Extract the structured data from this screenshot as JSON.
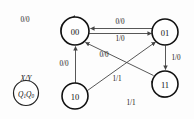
{
  "diagram": {
    "kind": "mealy-state-transition-diagram",
    "width": 194,
    "height": 119,
    "background_color": "#fdfdfd",
    "node_stroke_color": "#111111",
    "edge_stroke_color": "#444444",
    "text_color": "#111111"
  },
  "legend": {
    "name": "legend-key",
    "io_label": "X/Y",
    "state_label_prefix": "Q",
    "state_label": "Q1Q0",
    "state_sub_high": "1",
    "state_sub_low": "0",
    "state_letter": "Q"
  },
  "states": [
    {
      "id": "s00",
      "label": "00",
      "cx": 75,
      "cy": 31,
      "r": 14
    },
    {
      "id": "s01",
      "label": "01",
      "cx": 165,
      "cy": 32,
      "r": 13
    },
    {
      "id": "s11",
      "label": "11",
      "cx": 165,
      "cy": 84,
      "r": 13
    },
    {
      "id": "s10",
      "label": "10",
      "cx": 75,
      "cy": 96,
      "r": 13
    }
  ],
  "transitions": [
    {
      "id": "t-00-00",
      "from": "00",
      "to": "00",
      "label": "0/0",
      "input": "0",
      "output": "0",
      "shape": "self-loop-left",
      "label_x": 25,
      "label_y": 20
    },
    {
      "id": "t-01-00",
      "from": "01",
      "to": "00",
      "label": "0/0",
      "input": "0",
      "output": "0",
      "shape": "horizontal-upper",
      "label_x": 120,
      "label_y": 22
    },
    {
      "id": "t-00-01",
      "from": "00",
      "to": "01",
      "label": "1/0",
      "input": "1",
      "output": "0",
      "shape": "horizontal-lower",
      "label_x": 120,
      "label_y": 39
    },
    {
      "id": "t-01-11",
      "from": "01",
      "to": "11",
      "label": "1/0",
      "input": "1",
      "output": "0",
      "shape": "vertical-right",
      "label_x": 176,
      "label_y": 58
    },
    {
      "id": "t-11-11",
      "from": "11",
      "to": "11",
      "label": "1/1",
      "input": "1",
      "output": "1",
      "shape": "self-loop-bottom",
      "label_x": 131,
      "label_y": 103
    },
    {
      "id": "t-11-00",
      "from": "11",
      "to": "00",
      "label": "0/0",
      "input": "0",
      "output": "0",
      "shape": "diagonal-up-left",
      "label_x": 104,
      "label_y": 55
    },
    {
      "id": "t-10-00",
      "from": "10",
      "to": "00",
      "label": "0/0",
      "input": "0",
      "output": "0",
      "shape": "vertical-left",
      "label_x": 64,
      "label_y": 64
    },
    {
      "id": "t-10-01",
      "from": "10",
      "to": "01",
      "label": "1/1",
      "input": "1",
      "output": "1",
      "shape": "diagonal-up-right",
      "label_x": 117,
      "label_y": 79
    }
  ]
}
